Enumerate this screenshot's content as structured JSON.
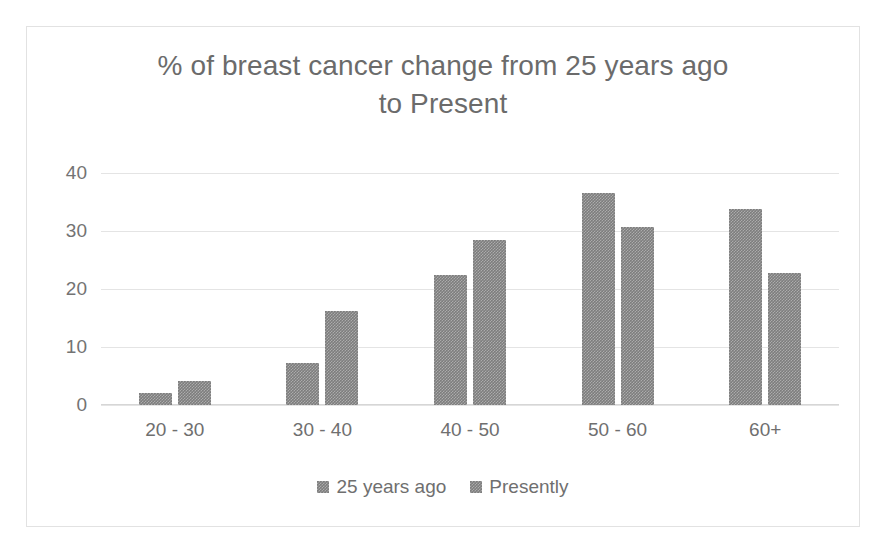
{
  "chart_data": {
    "type": "bar",
    "title": "% of breast cancer change from 25 years ago\nto Present",
    "xlabel": "",
    "ylabel": "",
    "categories": [
      "20 - 30",
      "30 - 40",
      "40 - 50",
      "50 - 60",
      "60+"
    ],
    "series": [
      {
        "name": "25 years ago",
        "values": [
          2.0,
          7.3,
          22.4,
          36.6,
          33.8
        ]
      },
      {
        "name": "Presently",
        "values": [
          4.1,
          16.2,
          28.4,
          30.7,
          22.7
        ]
      }
    ],
    "ylim": [
      0,
      40
    ],
    "yticks": [
      0,
      10,
      20,
      30,
      40
    ],
    "ytick_labels": [
      "0",
      "10",
      "20",
      "30",
      "40"
    ],
    "grid": true,
    "legend_position": "bottom",
    "colors": {
      "bar": "#7d7d7d",
      "title_text": "#6b6b6b",
      "tick_text": "#6f6f6f",
      "gridline": "#e4e4e4",
      "frame_border": "#e2e2e2",
      "background": "#ffffff"
    }
  }
}
